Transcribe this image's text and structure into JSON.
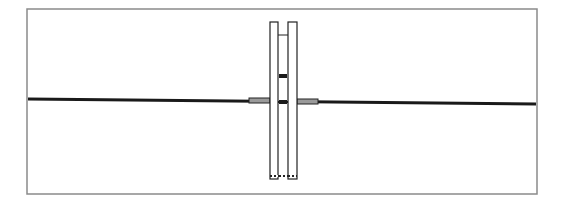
{
  "diagram": {
    "type": "mechanical-schematic",
    "colors": {
      "background": "#ffffff",
      "frame": "#8a8a8a",
      "line": "#1a1a1a",
      "sleeve_fill": "#9a9a9a",
      "column_stroke": "#222222",
      "column_fill": "#ffffff"
    },
    "frame": {
      "x": 27,
      "y": 9,
      "width": 510,
      "height": 185
    },
    "shaft": {
      "x1": 28,
      "y1": 99,
      "x2": 536,
      "y2": 104,
      "stroke_width": 3
    },
    "columns": [
      {
        "name": "left-column",
        "x": 270,
        "y": 22,
        "width": 8,
        "height": 157
      },
      {
        "name": "right-column",
        "x": 288,
        "y": 22,
        "width": 9,
        "height": 157
      }
    ],
    "inner_channel": {
      "x": 278,
      "y": 35,
      "width": 10,
      "height": 144
    },
    "sleeves": [
      {
        "name": "left-sleeve",
        "x": 249,
        "y": 98,
        "width": 21,
        "height": 5
      },
      {
        "name": "right-sleeve",
        "x": 297,
        "y": 99,
        "width": 21,
        "height": 5
      }
    ],
    "markers": [
      {
        "name": "upper-block",
        "x": 279,
        "y": 74,
        "width": 8,
        "height": 4
      },
      {
        "name": "shaft-block",
        "x": 279,
        "y": 100,
        "width": 8,
        "height": 4
      }
    ],
    "base_dots": [
      272,
      276,
      281,
      285,
      290,
      294
    ]
  }
}
